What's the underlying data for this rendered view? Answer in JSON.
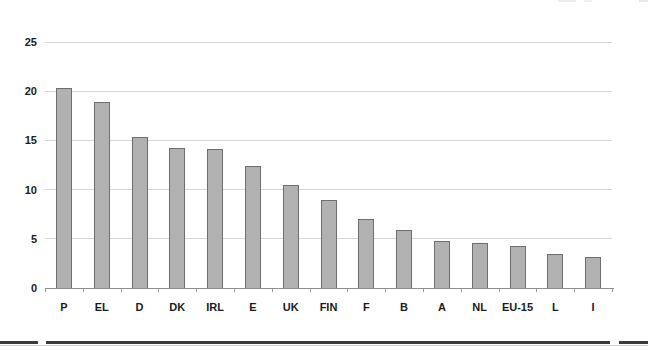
{
  "chart_data": {
    "type": "bar",
    "categories": [
      "P",
      "EL",
      "D",
      "DK",
      "IRL",
      "E",
      "UK",
      "FIN",
      "F",
      "B",
      "A",
      "NL",
      "EU-15",
      "L",
      "I"
    ],
    "values": [
      20.3,
      18.9,
      15.3,
      14.2,
      14.1,
      12.4,
      10.5,
      8.9,
      7.0,
      5.9,
      4.8,
      4.6,
      4.3,
      3.5,
      3.1
    ],
    "title": "",
    "xlabel": "",
    "ylabel": "",
    "ylim": [
      0,
      25
    ],
    "yticks": [
      0,
      5,
      10,
      15,
      20,
      25
    ],
    "grid": true,
    "legend_position": "none",
    "bar_fill_color": "#b1b1b1",
    "bar_border_color": "#6f6f6f",
    "gridline_color": "#d6d6d6",
    "axis_color": "#8e8e8e",
    "tick_color": "#9a9a9a",
    "label_color": "#1c1c1c"
  },
  "footer": {
    "rule_color": "#3b3b3b",
    "rule_shadow_color": "#cccccc"
  }
}
